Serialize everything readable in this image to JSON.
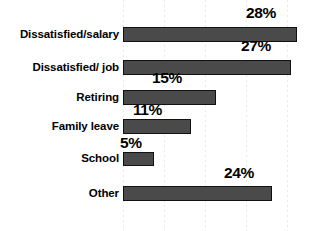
{
  "chart_data": {
    "type": "bar",
    "orientation": "horizontal",
    "title": "",
    "xlabel": "",
    "ylabel": "",
    "categories": [
      "Dissatisfied/salary",
      "Dissatisfied/ job",
      "Retiring",
      "Family leave",
      "School",
      "Other"
    ],
    "values": [
      28,
      27,
      15,
      11,
      5,
      24
    ],
    "value_labels": [
      "28%",
      "27%",
      "15%",
      "11%",
      "5%",
      "24%"
    ],
    "xlim": [
      0,
      31
    ],
    "grid": true,
    "grid_orientation": "vertical",
    "legend": "none",
    "series": [
      {
        "name": "",
        "values": [
          28,
          27,
          15,
          11,
          5,
          24
        ]
      }
    ]
  },
  "style": {
    "bar_fill": "#4a4a4a",
    "bar_stroke": "#111111",
    "background": "#ffffff",
    "gridline_color": "#e9e9e9",
    "text_color": "#000000"
  },
  "geometry": {
    "bar_origin_x": 123,
    "px_per_percent": 6.22,
    "gridlines_x": [
      123,
      164,
      205,
      246,
      287
    ],
    "rows": [
      {
        "bar_top": 27,
        "bar_height": 15,
        "label_top": 28,
        "value_top": 5,
        "value_left": 246
      },
      {
        "bar_top": 60,
        "bar_height": 15,
        "label_top": 61,
        "value_top": 38,
        "value_left": 241
      },
      {
        "bar_top": 90,
        "bar_height": 15,
        "label_top": 91,
        "value_top": 70,
        "value_left": 152
      },
      {
        "bar_top": 119,
        "bar_height": 15,
        "label_top": 120,
        "value_top": 102,
        "value_left": 133
      },
      {
        "bar_top": 152,
        "bar_height": 14,
        "label_top": 152,
        "value_top": 135,
        "value_left": 120
      },
      {
        "bar_top": 186,
        "bar_height": 15,
        "label_top": 187,
        "value_top": 165,
        "value_left": 224
      }
    ]
  }
}
